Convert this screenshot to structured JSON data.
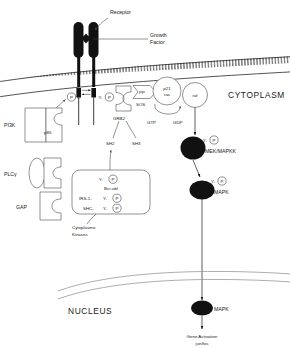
{
  "diagram": {
    "title_labels": {
      "receptor": "Receptor",
      "growth_factor_line1": "Growth",
      "growth_factor_line2": "Factor",
      "cytoplasm": "CYTOPLASM",
      "nucleus": "NUCLEUS"
    },
    "membrane": {
      "name": "plasma-membrane",
      "style": "lipid-bilayer"
    },
    "receptor_phospho": {
      "left_p": "P",
      "left_y": "Y-",
      "right_y": "Y-",
      "right_p": "P"
    },
    "left_proteins": [
      {
        "label": "PI3K",
        "subunit": "p85"
      },
      {
        "label": "PLCγ",
        "subunit": ""
      },
      {
        "label": "GAP",
        "subunit": ""
      }
    ],
    "adaptor": {
      "grb2": "GRB2",
      "sh2": "SH2",
      "sh3": "SH3",
      "sos": "SOS",
      "sos_pp": "PP"
    },
    "ras_module": {
      "p21_line1": "p21",
      "p21_line2": "ras",
      "raf": "raf",
      "gtp": "GTP",
      "gdp": "GDP"
    },
    "kinase_box": {
      "caption_line1": "Cytoplasmic",
      "caption_line2": "Kinases",
      "entries": [
        {
          "prefix": "",
          "y": "Y-",
          "p": "P",
          "name": "Bcr-abl"
        },
        {
          "prefix": "IRS-1-",
          "y": "Y-",
          "p": "P",
          "name": ""
        },
        {
          "prefix": "SHC-",
          "y": "Y-",
          "p": "P",
          "name": ""
        }
      ]
    },
    "cascade": [
      {
        "name": "MEK/MAPKK",
        "y": "Y-",
        "p": "P"
      },
      {
        "name": "MAPK",
        "y": "Y-",
        "p": "P"
      }
    ],
    "nucleus_node": {
      "name": "MAPK"
    },
    "outcome": {
      "line1": "Gene Activation",
      "line2": "jun/fos"
    },
    "colors": {
      "ink": "#1a1a1a",
      "outline": "#4a4a4a",
      "grey_line": "#8a8a8a",
      "blob": "#111111",
      "background": "#ffffff"
    }
  }
}
